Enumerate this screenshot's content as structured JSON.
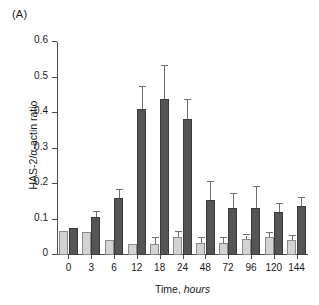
{
  "panel": {
    "label": "(A)"
  },
  "chart_data": {
    "type": "bar",
    "title": "",
    "xlabel_prefix": "Time,",
    "xlabel_italic": "hours",
    "xlabel": "Time, hours",
    "ylabel": "HAS-2/α-actin ratio",
    "categories": [
      "0",
      "3",
      "6",
      "12",
      "18",
      "24",
      "48",
      "72",
      "96",
      "120",
      "144"
    ],
    "ylim": [
      0,
      0.6
    ],
    "ytick_labels": [
      "0",
      "0.1",
      "0.2",
      "0.3",
      "0.4",
      "0.5",
      "0.6"
    ],
    "ytick_values": [
      0,
      0.1,
      0.2,
      0.3,
      0.4,
      0.5,
      0.6
    ],
    "grid": false,
    "legend": "none",
    "colors": {
      "series_0": "#d3d3d3",
      "series_1": "#555555",
      "axis": "#4d4d4d",
      "error": "#6f6f6f"
    },
    "series": [
      {
        "name": "series-light",
        "color": "#d3d3d3",
        "values": [
          0.068,
          0.066,
          0.043,
          0.031,
          0.031,
          0.052,
          0.035,
          0.035,
          0.044,
          0.052,
          0.041
        ],
        "errors": [
          0.0,
          0.0,
          0.0,
          0.0,
          0.016,
          0.014,
          0.013,
          0.013,
          0.011,
          0.009,
          0.013
        ]
      },
      {
        "name": "series-dark",
        "color": "#555555",
        "values": [
          0.075,
          0.107,
          0.162,
          0.41,
          0.44,
          0.384,
          0.155,
          0.133,
          0.133,
          0.122,
          0.139
        ],
        "errors": [
          0.0,
          0.013,
          0.021,
          0.064,
          0.093,
          0.052,
          0.05,
          0.038,
          0.06,
          0.021,
          0.021
        ]
      }
    ]
  }
}
